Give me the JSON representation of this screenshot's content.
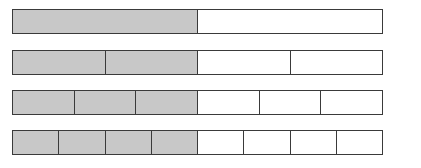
{
  "diagram": {
    "type": "fraction-bars",
    "colors": {
      "shaded": "#c8c8c8",
      "unshaded": "#ffffff",
      "border": "#3a3a3a"
    },
    "bars": [
      {
        "parts": 2,
        "shaded": 1,
        "fraction": "1/2"
      },
      {
        "parts": 4,
        "shaded": 2,
        "fraction": "2/4"
      },
      {
        "parts": 6,
        "shaded": 3,
        "fraction": "3/6"
      },
      {
        "parts": 8,
        "shaded": 4,
        "fraction": "4/8"
      }
    ]
  }
}
